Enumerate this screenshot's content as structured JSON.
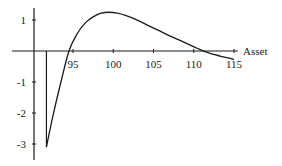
{
  "chart_data": {
    "type": "line",
    "title": "",
    "xlabel": "Asset",
    "ylabel": "",
    "xlim": [
      86.5,
      115.5
    ],
    "ylim": [
      -3.4,
      1.5
    ],
    "x_ticks": [
      95,
      100,
      105,
      110,
      115
    ],
    "x_tick_labels": [
      "95",
      "100",
      "105",
      "110",
      "115"
    ],
    "y_ticks": [
      1,
      -1,
      -2,
      -3
    ],
    "y_tick_labels": [
      "1",
      "-1",
      "-2",
      "-3"
    ],
    "grid": false,
    "legend": null,
    "annotations": [
      "vertical line from y=0 to y=-3.1 at x≈91.7"
    ],
    "series": [
      {
        "name": "P&L",
        "x": [
          91.7,
          92.5,
          93.5,
          94.5,
          95.5,
          96.5,
          97.5,
          98.5,
          99.5,
          100.5,
          101.5,
          102.5,
          103.5,
          104.5,
          105.5,
          106.5,
          107.5,
          108.5,
          109.5,
          110.5,
          111.5,
          112.5,
          113.5,
          114.5,
          115
        ],
        "values": [
          -3.1,
          -2.1,
          -1.0,
          0.0,
          0.55,
          0.9,
          1.1,
          1.22,
          1.25,
          1.22,
          1.15,
          1.05,
          0.93,
          0.8,
          0.68,
          0.55,
          0.43,
          0.32,
          0.2,
          0.08,
          -0.03,
          -0.11,
          -0.18,
          -0.24,
          -0.27
        ]
      }
    ]
  }
}
